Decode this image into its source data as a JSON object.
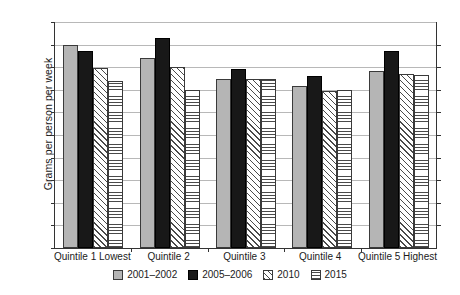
{
  "chart_data": {
    "type": "bar",
    "title": "",
    "xlabel": "",
    "ylabel": "Grams per person per week",
    "ylim": [
      0,
      200
    ],
    "yticks": [
      0,
      20,
      40,
      60,
      80,
      100,
      120,
      140,
      160,
      180,
      200
    ],
    "grid": true,
    "legend_position": "bottom",
    "categories": [
      "Quintile 1 Lowest",
      "Quintile 2",
      "Quintile 3",
      "Quintile 4",
      "Quintile 5 Highest"
    ],
    "series": [
      {
        "name": "2001–2002",
        "color": "#b5b5b5",
        "pattern": "solid-gray",
        "values": [
          180,
          168,
          150,
          143,
          157
        ]
      },
      {
        "name": "2005–2006",
        "color": "#181818",
        "pattern": "solid-black",
        "values": [
          174,
          186,
          158,
          152,
          174
        ]
      },
      {
        "name": "2010",
        "color": "#ffffff",
        "pattern": "diagonal-hatch",
        "values": [
          159,
          160,
          150,
          139,
          154
        ]
      },
      {
        "name": "2015",
        "color": "#ffffff",
        "pattern": "horizontal-hatch",
        "values": [
          148,
          140,
          150,
          140,
          153
        ]
      }
    ]
  }
}
